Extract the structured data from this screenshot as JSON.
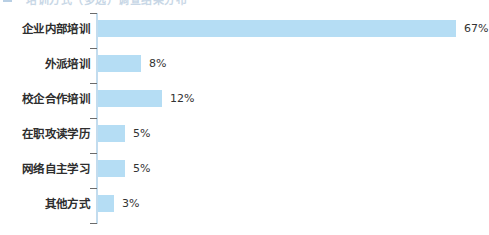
{
  "header": {
    "remnant_text": "培训方式（多选）调查结果分布",
    "remnant_icon": "bullet-square-icon"
  },
  "colors": {
    "bar_fill": "#b5ddf4",
    "axis_line": "#c3dcee",
    "tick": "#6b6b6b",
    "label_text": "#2e2e2e",
    "value_text": "#333333",
    "background": "#ffffff"
  },
  "chart_data": {
    "type": "bar",
    "orientation": "horizontal",
    "title": "",
    "xlabel": "",
    "ylabel": "",
    "grid": false,
    "legend": "none",
    "xlim": [
      0,
      70
    ],
    "unit": "%",
    "categories": [
      "企业内部培训",
      "外派培训",
      "校企合作培训",
      "在职攻读学历",
      "网络自主学习",
      "其他方式"
    ],
    "values": [
      67,
      8,
      12,
      5,
      5,
      3
    ],
    "value_labels": [
      "67%",
      "8%",
      "12%",
      "5%",
      "5%",
      "3%"
    ]
  }
}
